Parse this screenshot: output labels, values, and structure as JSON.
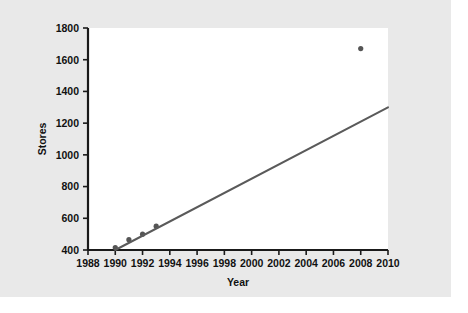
{
  "figure": {
    "background_color": "#e9e9e9",
    "plot_background_color": "#ffffff",
    "line_color": "#5a5a5a",
    "marker_color": "#555555",
    "axis_color": "#1a1a1a"
  },
  "chart_data": {
    "type": "scatter",
    "title": "",
    "xlabel": "Year",
    "ylabel": "Stores",
    "xlim": [
      1988,
      2010
    ],
    "ylim": [
      400,
      1800
    ],
    "xticks": [
      1988,
      1990,
      1992,
      1994,
      1996,
      1998,
      2000,
      2002,
      2004,
      2006,
      2008,
      2010
    ],
    "yticks": [
      400,
      600,
      800,
      1000,
      1200,
      1400,
      1600,
      1800
    ],
    "xtick_labels": [
      "1988",
      "1990",
      "1992",
      "1994",
      "1996",
      "1998",
      "2000",
      "2002",
      "2004",
      "2006",
      "2008",
      "2010"
    ],
    "ytick_labels": [
      "400",
      "600",
      "800",
      "1000",
      "1200",
      "1400",
      "1600",
      "1800"
    ],
    "grid": false,
    "legend": false,
    "series": [
      {
        "name": "Stores",
        "type": "scatter",
        "points": [
          {
            "x": 1990,
            "y": 415
          },
          {
            "x": 1991,
            "y": 465
          },
          {
            "x": 1992,
            "y": 500
          },
          {
            "x": 1993,
            "y": 550
          },
          {
            "x": 2008,
            "y": 1670
          }
        ]
      },
      {
        "name": "Linear fit",
        "type": "line",
        "points": [
          {
            "x": 1990,
            "y": 400
          },
          {
            "x": 2010,
            "y": 1300
          }
        ]
      }
    ]
  }
}
